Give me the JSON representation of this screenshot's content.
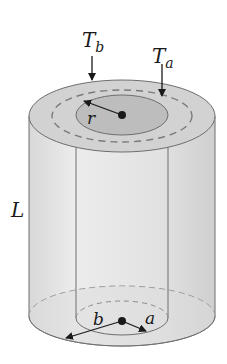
{
  "diagram": {
    "labels": {
      "T_b_main": "T",
      "T_b_sub": "b",
      "T_a_main": "T",
      "T_a_sub": "a",
      "r": "r",
      "L": "L",
      "b": "b",
      "a": "a"
    },
    "colors": {
      "outer_shell": "#e6e6e6",
      "top_annulus": "#d2d2d2",
      "inner_top": "#bdbdbd",
      "stroke": "#6e6e6e",
      "dashed": "#7a7a7a",
      "arrow": "#1a1a1a"
    }
  }
}
